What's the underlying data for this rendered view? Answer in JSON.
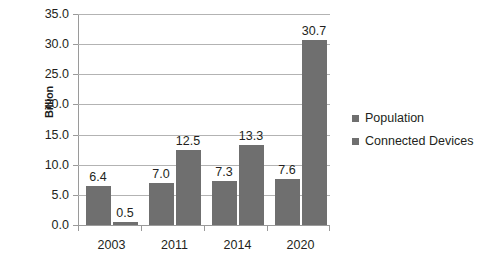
{
  "chart_data": {
    "type": "bar",
    "title": "",
    "subtitle": "",
    "xlabel": "",
    "ylabel": "Billion",
    "categories": [
      "2003",
      "2011",
      "2014",
      "2020"
    ],
    "series": [
      {
        "name": "Population",
        "values": [
          6.4,
          7.0,
          7.3,
          7.6
        ],
        "color": "#6f6f6f"
      },
      {
        "name": "Connected Devices",
        "values": [
          0.5,
          12.5,
          13.3,
          30.7
        ],
        "color": "#6f6f6f"
      }
    ],
    "value_labels": [
      [
        "6.4",
        "7.0",
        "7.3",
        "7.6"
      ],
      [
        "0.5",
        "12.5",
        "13.3",
        "30.7"
      ]
    ],
    "ylim": [
      0,
      35
    ],
    "ytick_step": 5,
    "ytick_labels": [
      "0.0",
      "5.0",
      "10.0",
      "15.0",
      "20.0",
      "25.0",
      "30.0",
      "35.0"
    ],
    "grid": true,
    "grid_axis": "y",
    "legend_position": "right",
    "data_labels": true,
    "colors": {
      "bar": "#6f6f6f",
      "gridline": "#b3b3b3",
      "axis": "#9a9a9a",
      "text": "#231f20",
      "background": "#ffffff"
    }
  },
  "axis": {
    "y_title": "Billion"
  },
  "legend": {
    "items": [
      {
        "label": "Population",
        "marker": "square-swatch-icon"
      },
      {
        "label": "Connected Devices",
        "marker": "square-swatch-icon"
      }
    ]
  }
}
